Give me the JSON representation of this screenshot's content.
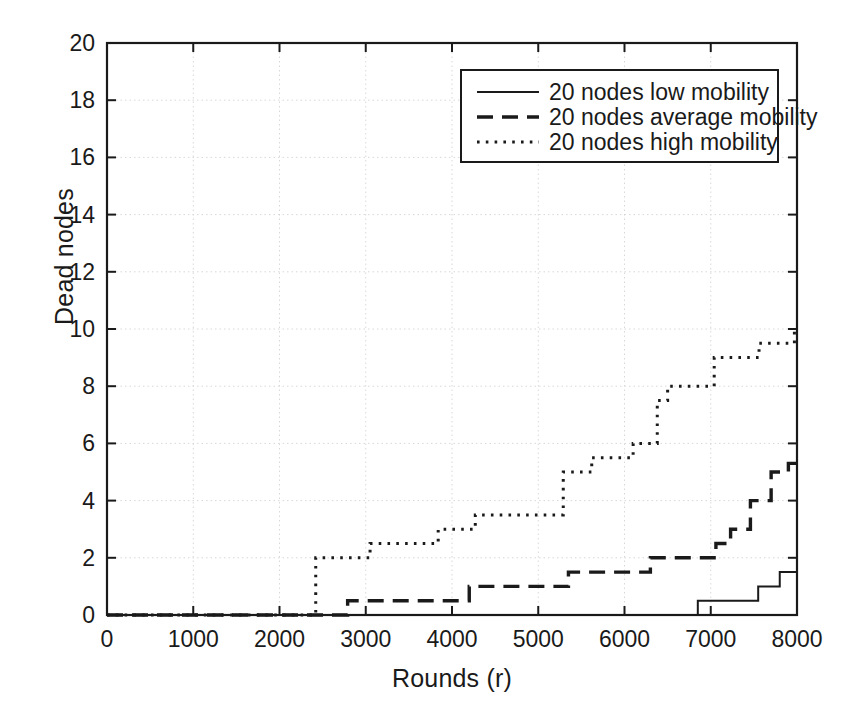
{
  "chart_data": {
    "type": "line",
    "title": "",
    "xlabel": "Rounds (r)",
    "ylabel": "Dead nodes",
    "xlim": [
      0,
      8000
    ],
    "ylim": [
      0,
      20
    ],
    "xticks": [
      0,
      1000,
      2000,
      3000,
      4000,
      5000,
      6000,
      7000,
      8000
    ],
    "yticks": [
      0,
      2,
      4,
      6,
      8,
      10,
      12,
      14,
      16,
      18,
      20
    ],
    "xticklabels": [
      "0",
      "1000",
      "2000",
      "3000",
      "4000",
      "5000",
      "6000",
      "7000",
      "8000"
    ],
    "yticklabels": [
      "0",
      "2",
      "4",
      "6",
      "8",
      "10",
      "12",
      "14",
      "16",
      "18",
      "20"
    ],
    "grid": true,
    "legend_position": "upper right",
    "series": [
      {
        "name": "20 nodes low mobility",
        "style": "solid",
        "points": [
          [
            0,
            0
          ],
          [
            6850,
            0
          ],
          [
            6850,
            0.5
          ],
          [
            7550,
            0.5
          ],
          [
            7550,
            1.0
          ],
          [
            7800,
            1.0
          ],
          [
            7800,
            1.5
          ],
          [
            8000,
            1.5
          ]
        ]
      },
      {
        "name": "20 nodes average mobility",
        "style": "dashed",
        "points": [
          [
            0,
            0
          ],
          [
            2790,
            0
          ],
          [
            2790,
            0.5
          ],
          [
            4200,
            0.5
          ],
          [
            4200,
            1.0
          ],
          [
            5350,
            1.0
          ],
          [
            5350,
            1.5
          ],
          [
            6300,
            1.5
          ],
          [
            6300,
            2.0
          ],
          [
            7060,
            2.0
          ],
          [
            7060,
            2.5
          ],
          [
            7230,
            2.5
          ],
          [
            7230,
            3.0
          ],
          [
            7460,
            3.0
          ],
          [
            7460,
            4.0
          ],
          [
            7700,
            4.0
          ],
          [
            7700,
            5.0
          ],
          [
            7900,
            5.0
          ],
          [
            7900,
            5.3
          ],
          [
            8000,
            5.3
          ]
        ]
      },
      {
        "name": "20 nodes high mobility",
        "style": "dotted",
        "points": [
          [
            0,
            0
          ],
          [
            2420,
            0
          ],
          [
            2420,
            2.0
          ],
          [
            3050,
            2.0
          ],
          [
            3050,
            2.5
          ],
          [
            3840,
            2.5
          ],
          [
            3840,
            3.0
          ],
          [
            4270,
            3.0
          ],
          [
            4270,
            3.5
          ],
          [
            5290,
            3.5
          ],
          [
            5290,
            5.0
          ],
          [
            5620,
            5.0
          ],
          [
            5620,
            5.5
          ],
          [
            6100,
            5.5
          ],
          [
            6100,
            6.0
          ],
          [
            6380,
            6.0
          ],
          [
            6380,
            7.5
          ],
          [
            6500,
            7.5
          ],
          [
            6500,
            8.0
          ],
          [
            7040,
            8.0
          ],
          [
            7040,
            9.0
          ],
          [
            7560,
            9.0
          ],
          [
            7560,
            9.5
          ],
          [
            7970,
            9.5
          ],
          [
            7970,
            10.0
          ],
          [
            8000,
            10.0
          ]
        ]
      }
    ]
  },
  "legend": {
    "items": [
      {
        "label": "20 nodes low mobility",
        "style": "solid"
      },
      {
        "label": "20 nodes average mobility",
        "style": "dashed"
      },
      {
        "label": "20 nodes high mobility",
        "style": "dotted"
      }
    ]
  },
  "colors": {
    "axis": "#1a1a1a",
    "grid": "#d8d8d8",
    "series": "#1a1a1a",
    "background": "#ffffff"
  }
}
